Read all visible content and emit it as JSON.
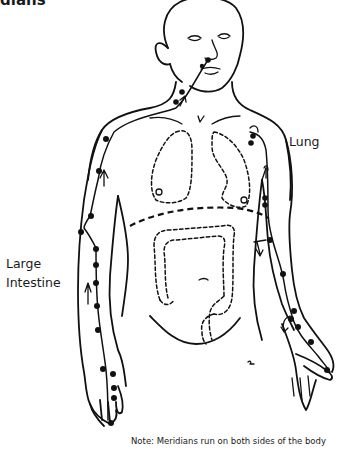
{
  "figure": {
    "title_fragment": "dians",
    "labels": {
      "lung": "Lung",
      "large_intestine_line1": "Large",
      "large_intestine_line2": "Intestine"
    },
    "note": "Note: Meridians run on both sides of the body",
    "meridians": [
      {
        "name": "Lung",
        "side": "figure-left arm (viewer's right)",
        "direction": "down toward thumb"
      },
      {
        "name": "Large Intestine",
        "side": "figure-right arm (viewer's left)",
        "direction": "up from index finger to face"
      }
    ],
    "organs_shown": [
      "lungs",
      "large intestine"
    ],
    "colors": {
      "line": "#111111",
      "background": "#ffffff"
    }
  }
}
